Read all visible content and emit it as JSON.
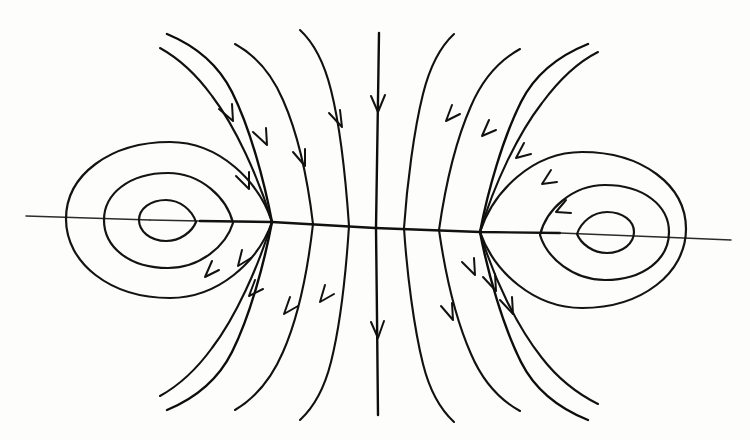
{
  "figure": {
    "kind": "phase-portrait",
    "background_color": "#fdfdfb",
    "ink_color": "#111111",
    "width": 750,
    "height": 440,
    "caption": ""
  },
  "chart_data": {
    "type": "scatter",
    "xlabel": "",
    "ylabel": "",
    "grid": false,
    "legend": "none",
    "xlim": [
      0,
      750
    ],
    "ylim": [
      440,
      0
    ],
    "annotations": [],
    "critical_points": [
      {
        "name": "center-left",
        "type": "center",
        "x": 168,
        "y": 220
      },
      {
        "name": "saddle",
        "type": "saddle",
        "x": 375,
        "y": 228
      },
      {
        "name": "center-right",
        "type": "center",
        "x": 605,
        "y": 232
      }
    ],
    "axis_line": {
      "x1": 25,
      "y1": 216,
      "x2": 730,
      "y2": 240
    },
    "separatrix_cusps": [
      {
        "x": 272,
        "y": 222
      },
      {
        "x": 480,
        "y": 232
      }
    ],
    "flow_direction": "downward",
    "series": [
      {
        "name": "left-orbit-inner",
        "kind": "closed-orbit",
        "center": [
          168,
          220
        ],
        "rx": 30,
        "ry": 22,
        "closed": true
      },
      {
        "name": "left-orbit-middle",
        "kind": "closed-orbit",
        "center": [
          168,
          220
        ],
        "rx": 62,
        "ry": 48,
        "closed": true
      },
      {
        "name": "left-orbit-outer",
        "kind": "closed-orbit",
        "center": [
          168,
          220
        ],
        "rx": 98,
        "ry": 78,
        "closed": true
      },
      {
        "name": "right-orbit-inner",
        "kind": "closed-orbit",
        "center": [
          605,
          232
        ],
        "rx": 30,
        "ry": 22,
        "closed": true
      },
      {
        "name": "right-orbit-middle",
        "kind": "closed-orbit",
        "center": [
          605,
          232
        ],
        "rx": 62,
        "ry": 48,
        "closed": true
      },
      {
        "name": "right-orbit-outer",
        "kind": "closed-orbit",
        "center": [
          605,
          232
        ],
        "rx": 98,
        "ry": 78,
        "closed": true
      },
      {
        "name": "separatrix-left",
        "kind": "separatrix",
        "cusp": [
          272,
          222
        ],
        "closed": false
      },
      {
        "name": "separatrix-right",
        "kind": "separatrix",
        "cusp": [
          480,
          232
        ],
        "closed": false
      },
      {
        "name": "vertical-separatrix",
        "kind": "separatrix",
        "x": 377,
        "y_top": 33,
        "y_bottom": 415,
        "closed": false
      }
    ],
    "arrow_count": 21,
    "arrows": [
      {
        "x": 390,
        "y": 108,
        "angle": 90
      },
      {
        "x": 380,
        "y": 330,
        "angle": 90
      },
      {
        "x": 313,
        "y": 123,
        "angle": 118
      },
      {
        "x": 281,
        "y": 160,
        "angle": 110
      },
      {
        "x": 251,
        "y": 147,
        "angle": 128
      },
      {
        "x": 238,
        "y": 186,
        "angle": 118
      },
      {
        "x": 284,
        "y": 312,
        "angle": 62
      },
      {
        "x": 248,
        "y": 275,
        "angle": 70
      },
      {
        "x": 236,
        "y": 257,
        "angle": 62
      },
      {
        "x": 318,
        "y": 292,
        "angle": 70
      },
      {
        "x": 455,
        "y": 118,
        "angle": 62
      },
      {
        "x": 491,
        "y": 133,
        "angle": 52
      },
      {
        "x": 522,
        "y": 155,
        "angle": 40
      },
      {
        "x": 545,
        "y": 182,
        "angle": 28
      },
      {
        "x": 460,
        "y": 330,
        "angle": 118
      },
      {
        "x": 490,
        "y": 280,
        "angle": 118
      },
      {
        "x": 505,
        "y": 300,
        "angle": 110
      },
      {
        "x": 470,
        "y": 265,
        "angle": 122
      }
    ]
  }
}
